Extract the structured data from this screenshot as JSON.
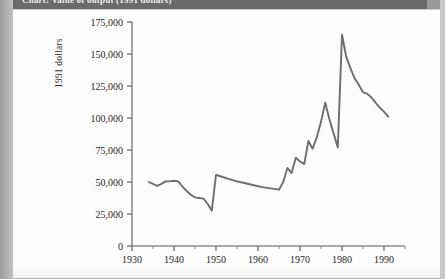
{
  "caption": {
    "text": "Chart: Value of output (1991 dollars)"
  },
  "chart_data": {
    "type": "line",
    "title": "",
    "xlabel": "",
    "ylabel": "1991 dollars",
    "xlim": [
      1930,
      1995
    ],
    "ylim": [
      0,
      175000
    ],
    "grid": false,
    "legend": "none",
    "y_ticks": [
      0,
      25000,
      50000,
      75000,
      100000,
      125000,
      150000,
      175000
    ],
    "y_tick_labels": [
      "0",
      "25,000",
      "50,000",
      "75,000",
      "100,000",
      "125,000",
      "150,000",
      "175,000"
    ],
    "x_ticks": [
      1930,
      1940,
      1950,
      1960,
      1970,
      1980,
      1990
    ],
    "x_tick_labels": [
      "1930",
      "1940",
      "1950",
      "1960",
      "1970",
      "1980",
      "1990"
    ],
    "x_minor_ticks": [
      1935,
      1945,
      1955,
      1965,
      1975,
      1985,
      1995
    ],
    "series": [
      {
        "name": "1991 dollars",
        "color": "#6d6d6d",
        "x": [
          1934,
          1936,
          1937,
          1938,
          1939,
          1940,
          1941,
          1942,
          1943,
          1944,
          1945,
          1946,
          1947,
          1948,
          1949,
          1950,
          1951,
          1953,
          1955,
          1957,
          1959,
          1961,
          1963,
          1965,
          1966,
          1967,
          1968,
          1969,
          1970,
          1971,
          1972,
          1973,
          1974,
          1975,
          1976,
          1977,
          1978,
          1979,
          1980,
          1981,
          1982,
          1983,
          1984,
          1985,
          1986,
          1987,
          1988,
          1989,
          1990,
          1991
        ],
        "values": [
          50000,
          47000,
          48500,
          50500,
          50500,
          51000,
          50500,
          46500,
          43000,
          40000,
          38000,
          37500,
          37000,
          33000,
          27500,
          55500,
          54500,
          52500,
          50500,
          49000,
          47500,
          46000,
          45000,
          44000,
          50000,
          61000,
          57000,
          69000,
          66000,
          64000,
          82000,
          76000,
          85000,
          97000,
          112000,
          99000,
          88000,
          77000,
          165000,
          148000,
          139000,
          131000,
          126000,
          120000,
          119000,
          116000,
          112000,
          108000,
          105000,
          101000
        ]
      }
    ]
  }
}
